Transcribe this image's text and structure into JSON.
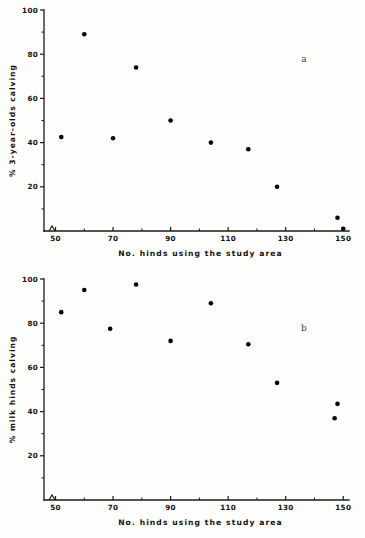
{
  "figure": {
    "background_color": "#fdfdfc",
    "ink_color": "#111111",
    "point_color": "#000000"
  },
  "chart_data": [
    {
      "type": "scatter",
      "panel_label": "a",
      "title": "",
      "xlabel": "No. hinds using the study area",
      "ylabel": "% 3-year-olds calving",
      "xlim": [
        46,
        152
      ],
      "ylim": [
        0,
        100
      ],
      "axis_break_x": true,
      "grid": false,
      "legend": "none",
      "xticks": [
        50,
        70,
        90,
        110,
        130,
        150
      ],
      "xtick_labels": [
        "50",
        "70",
        "90",
        "110",
        "130",
        "150"
      ],
      "xminor_ticks": [
        60,
        80,
        100,
        120,
        140
      ],
      "yticks": [
        20,
        40,
        60,
        80,
        100
      ],
      "ytick_labels": [
        "20",
        "40",
        "60",
        "80",
        "100"
      ],
      "yminor_ticks": [
        10,
        30,
        50,
        70,
        90
      ],
      "points": [
        {
          "x": 52,
          "y": 42.5
        },
        {
          "x": 60,
          "y": 89.0
        },
        {
          "x": 70,
          "y": 42.0
        },
        {
          "x": 78,
          "y": 74.0
        },
        {
          "x": 90,
          "y": 50.0
        },
        {
          "x": 104,
          "y": 40.0
        },
        {
          "x": 117,
          "y": 37.0
        },
        {
          "x": 127,
          "y": 20.0
        },
        {
          "x": 148,
          "y": 6.0
        },
        {
          "x": 150,
          "y": 1.0
        }
      ]
    },
    {
      "type": "scatter",
      "panel_label": "b",
      "title": "",
      "xlabel": "No. hinds using the study area",
      "ylabel": "% milk hinds calving",
      "xlim": [
        46,
        152
      ],
      "ylim": [
        0,
        100
      ],
      "axis_break_x": true,
      "grid": false,
      "legend": "none",
      "xticks": [
        50,
        70,
        90,
        110,
        130,
        150
      ],
      "xtick_labels": [
        "50",
        "70",
        "90",
        "110",
        "130",
        "150"
      ],
      "xminor_ticks": [
        60,
        80,
        100,
        120,
        140
      ],
      "yticks": [
        20,
        40,
        60,
        80,
        100
      ],
      "ytick_labels": [
        "20",
        "40",
        "60",
        "80",
        "100"
      ],
      "yminor_ticks": [
        10,
        30,
        50,
        70,
        90
      ],
      "points": [
        {
          "x": 52,
          "y": 85.0
        },
        {
          "x": 60,
          "y": 95.0
        },
        {
          "x": 69,
          "y": 77.5
        },
        {
          "x": 78,
          "y": 97.5
        },
        {
          "x": 90,
          "y": 72.0
        },
        {
          "x": 104,
          "y": 89.0
        },
        {
          "x": 117,
          "y": 70.5
        },
        {
          "x": 127,
          "y": 53.0
        },
        {
          "x": 148,
          "y": 43.5
        },
        {
          "x": 147,
          "y": 37.0
        }
      ]
    }
  ]
}
